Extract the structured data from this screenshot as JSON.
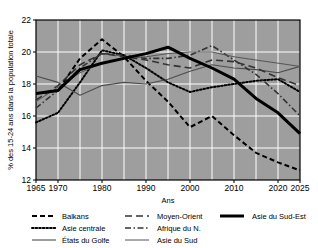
{
  "chart_data": {
    "type": "line",
    "title": "",
    "xlabel": "Ans",
    "ylabel": "% des 15-24 ans dans la population totale",
    "xlim": [
      1965,
      2025
    ],
    "ylim": [
      12,
      22
    ],
    "xticks": [
      1965,
      1970,
      1980,
      1990,
      2000,
      2010,
      2020,
      2025
    ],
    "yticks": [
      12,
      14,
      16,
      18,
      20,
      22
    ],
    "grid": true,
    "legend_position": "bottom",
    "x": [
      1965,
      1970,
      1975,
      1980,
      1985,
      1990,
      1995,
      2000,
      2005,
      2010,
      2015,
      2020,
      2025
    ],
    "series": [
      {
        "name": "Balkans",
        "style": "dashed",
        "color": "#000000",
        "width": 2.0,
        "values": [
          17.4,
          17.6,
          19.6,
          20.8,
          19.7,
          18.2,
          16.9,
          15.3,
          16.0,
          14.8,
          13.7,
          13.1,
          12.6
        ]
      },
      {
        "name": "Asie centrale",
        "style": "dotted",
        "color": "#000000",
        "width": 2.0,
        "values": [
          15.6,
          16.2,
          18.1,
          20.1,
          19.8,
          19.0,
          18.1,
          17.5,
          17.8,
          18.0,
          18.2,
          18.3,
          17.5
        ]
      },
      {
        "name": "États du Golfe",
        "style": "solid",
        "color": "#4d4d4d",
        "width": 1.1,
        "values": [
          18.5,
          18.1,
          17.3,
          17.9,
          18.1,
          18.0,
          18.3,
          18.8,
          19.2,
          19.0,
          18.9,
          18.7,
          19.1
        ]
      },
      {
        "name": "Moyen-Orient",
        "style": "longdash",
        "color": "#333333",
        "width": 1.6,
        "values": [
          17.0,
          17.9,
          19.2,
          19.9,
          19.7,
          19.5,
          19.2,
          19.0,
          19.5,
          19.4,
          19.0,
          18.4,
          17.9
        ]
      },
      {
        "name": "Afrique du N.",
        "style": "dashdot",
        "color": "#333333",
        "width": 1.6,
        "values": [
          16.5,
          17.6,
          19.0,
          19.9,
          19.8,
          19.6,
          19.6,
          19.8,
          20.4,
          19.5,
          18.6,
          17.4,
          16.0
        ]
      },
      {
        "name": "Asie du Sud",
        "style": "solid",
        "color": "#555555",
        "width": 1.0,
        "values": [
          16.9,
          17.8,
          18.7,
          19.3,
          19.6,
          19.7,
          19.9,
          20.0,
          20.0,
          19.7,
          19.5,
          19.3,
          19.1
        ]
      },
      {
        "name": "Asie du Sud-Est",
        "style": "solid",
        "color": "#000000",
        "width": 3.0,
        "values": [
          17.4,
          17.6,
          18.9,
          19.3,
          19.6,
          19.9,
          20.3,
          19.6,
          19.0,
          18.3,
          17.1,
          16.2,
          14.9
        ]
      }
    ]
  },
  "axes": {
    "xlabel": "Ans",
    "ylabel": "% des 15-24 ans dans la population totale",
    "xticks": [
      "1965",
      "1970",
      "1980",
      "1990",
      "2000",
      "2010",
      "2020",
      "2025"
    ],
    "yticks": [
      "12",
      "14",
      "16",
      "18",
      "20",
      "22"
    ]
  },
  "legend": {
    "columns": [
      [
        {
          "label": "Balkans",
          "key": "balkans"
        },
        {
          "label": "Asie centrale",
          "key": "asie-centrale"
        },
        {
          "label": "États du Golfe",
          "key": "etats-du-golfe"
        }
      ],
      [
        {
          "label": "Moyen-Orient",
          "key": "moyen-orient"
        },
        {
          "label": "Afrique du N.",
          "key": "afrique-du-nord"
        },
        {
          "label": "Asie du Sud",
          "key": "asie-du-sud"
        }
      ],
      [
        {
          "label": "Asie du Sud-Est",
          "key": "asie-du-sud-est"
        }
      ]
    ]
  },
  "style": {
    "plot_background": "#9e9e9e",
    "grid_color": "#ffffff",
    "frame_color": "#000000",
    "page_background": "#ffffff"
  }
}
